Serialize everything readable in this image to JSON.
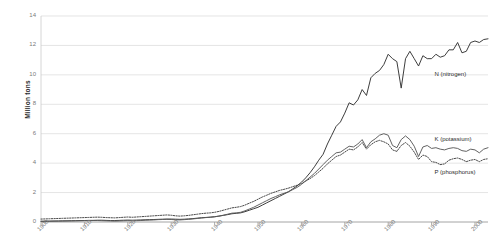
{
  "chart_data": {
    "type": "line",
    "title": "",
    "xlabel": "",
    "ylabel": "Million tons",
    "xlim": [
      1900,
      2003
    ],
    "ylim": [
      0,
      14
    ],
    "ytick_labels": [
      "0",
      "2",
      "4",
      "6",
      "8",
      "10",
      "12",
      "14"
    ],
    "ytick_values": [
      0,
      2,
      4,
      6,
      8,
      10,
      12,
      14
    ],
    "xtick_labels": [
      "1900",
      "1910",
      "1920",
      "1930",
      "1940",
      "1950",
      "1960",
      "1970",
      "1980",
      "1990",
      "2000"
    ],
    "xtick_values": [
      1900,
      1910,
      1920,
      1930,
      1940,
      1950,
      1960,
      1970,
      1980,
      1990,
      2000
    ],
    "grid": "horizontal",
    "legend_position": "inline-right",
    "series": [
      {
        "name": "N (nitrogen)",
        "style": "solid",
        "color": "#333333",
        "label_x": 2.5,
        "label_y": 10.0,
        "x": [
          1900,
          1901,
          1902,
          1903,
          1904,
          1905,
          1906,
          1907,
          1908,
          1909,
          1910,
          1911,
          1912,
          1913,
          1914,
          1915,
          1916,
          1917,
          1918,
          1919,
          1920,
          1921,
          1922,
          1923,
          1924,
          1925,
          1926,
          1927,
          1928,
          1929,
          1930,
          1931,
          1932,
          1933,
          1934,
          1935,
          1936,
          1937,
          1938,
          1939,
          1940,
          1941,
          1942,
          1943,
          1944,
          1945,
          1946,
          1947,
          1948,
          1949,
          1950,
          1951,
          1952,
          1953,
          1954,
          1955,
          1956,
          1957,
          1958,
          1959,
          1960,
          1961,
          1962,
          1963,
          1964,
          1965,
          1966,
          1967,
          1968,
          1969,
          1970,
          1971,
          1972,
          1973,
          1974,
          1975,
          1976,
          1977,
          1978,
          1979,
          1980,
          1981,
          1982,
          1983,
          1984,
          1985,
          1986,
          1987,
          1988,
          1989,
          1990,
          1991,
          1992,
          1993,
          1994,
          1995,
          1996,
          1997,
          1998,
          1999,
          2000,
          2001,
          2002,
          2003
        ],
        "y": [
          0.05,
          0.06,
          0.06,
          0.07,
          0.07,
          0.08,
          0.08,
          0.09,
          0.09,
          0.1,
          0.1,
          0.11,
          0.11,
          0.12,
          0.12,
          0.11,
          0.1,
          0.1,
          0.11,
          0.12,
          0.13,
          0.12,
          0.13,
          0.14,
          0.15,
          0.16,
          0.17,
          0.18,
          0.19,
          0.2,
          0.2,
          0.19,
          0.18,
          0.19,
          0.21,
          0.23,
          0.26,
          0.29,
          0.31,
          0.33,
          0.36,
          0.4,
          0.45,
          0.5,
          0.56,
          0.59,
          0.62,
          0.7,
          0.8,
          0.9,
          1.0,
          1.15,
          1.3,
          1.45,
          1.6,
          1.75,
          1.9,
          2.05,
          2.25,
          2.45,
          2.7,
          3.0,
          3.35,
          3.75,
          4.2,
          4.6,
          5.3,
          5.9,
          6.5,
          6.8,
          7.4,
          8.1,
          7.95,
          8.3,
          9.0,
          8.6,
          9.8,
          10.1,
          10.3,
          10.7,
          11.4,
          11.1,
          10.9,
          9.1,
          11.1,
          11.6,
          11.1,
          10.6,
          11.3,
          11.1,
          11.1,
          11.4,
          11.2,
          11.3,
          11.7,
          11.7,
          12.2,
          11.5,
          11.6,
          12.2,
          12.3,
          12.2,
          12.4,
          12.45
        ]
      },
      {
        "name": "K (potassium)",
        "style": "solid",
        "color": "#5a5a5a",
        "label_x": 2.5,
        "label_y": 5.6,
        "x": [
          1900,
          1901,
          1902,
          1903,
          1904,
          1905,
          1906,
          1907,
          1908,
          1909,
          1910,
          1911,
          1912,
          1913,
          1914,
          1915,
          1916,
          1917,
          1918,
          1919,
          1920,
          1921,
          1922,
          1923,
          1924,
          1925,
          1926,
          1927,
          1928,
          1929,
          1930,
          1931,
          1932,
          1933,
          1934,
          1935,
          1936,
          1937,
          1938,
          1939,
          1940,
          1941,
          1942,
          1943,
          1944,
          1945,
          1946,
          1947,
          1948,
          1949,
          1950,
          1951,
          1952,
          1953,
          1954,
          1955,
          1956,
          1957,
          1958,
          1959,
          1960,
          1961,
          1962,
          1963,
          1964,
          1965,
          1966,
          1967,
          1968,
          1969,
          1970,
          1971,
          1972,
          1973,
          1974,
          1975,
          1976,
          1977,
          1978,
          1979,
          1980,
          1981,
          1982,
          1983,
          1984,
          1985,
          1986,
          1987,
          1988,
          1989,
          1990,
          1991,
          1992,
          1993,
          1994,
          1995,
          1996,
          1997,
          1998,
          1999,
          2000,
          2001,
          2002,
          2003
        ],
        "y": [
          0.04,
          0.04,
          0.05,
          0.05,
          0.06,
          0.06,
          0.07,
          0.07,
          0.08,
          0.08,
          0.09,
          0.09,
          0.1,
          0.1,
          0.09,
          0.08,
          0.07,
          0.06,
          0.07,
          0.08,
          0.09,
          0.08,
          0.09,
          0.1,
          0.12,
          0.13,
          0.14,
          0.16,
          0.17,
          0.18,
          0.17,
          0.15,
          0.14,
          0.16,
          0.18,
          0.21,
          0.24,
          0.27,
          0.3,
          0.32,
          0.35,
          0.4,
          0.46,
          0.53,
          0.6,
          0.62,
          0.66,
          0.76,
          0.88,
          1.0,
          1.15,
          1.3,
          1.45,
          1.6,
          1.72,
          1.85,
          1.95,
          2.05,
          2.2,
          2.35,
          2.55,
          2.8,
          3.05,
          3.3,
          3.6,
          3.9,
          4.2,
          4.45,
          4.7,
          4.75,
          4.95,
          5.15,
          5.1,
          5.3,
          5.6,
          5.05,
          5.45,
          5.65,
          5.9,
          6.0,
          5.9,
          5.2,
          5.05,
          5.6,
          5.85,
          5.6,
          5.15,
          4.45,
          5.1,
          5.2,
          5.0,
          5.05,
          4.95,
          4.9,
          5.0,
          5.05,
          5.0,
          4.85,
          4.8,
          4.95,
          4.9,
          4.7,
          4.95,
          5.05
        ]
      },
      {
        "name": "P (phosphorus)",
        "style": "dotted",
        "color": "#4a4a4a",
        "label_x": 2.5,
        "label_y": 3.3,
        "x": [
          1900,
          1901,
          1902,
          1903,
          1904,
          1905,
          1906,
          1907,
          1908,
          1909,
          1910,
          1911,
          1912,
          1913,
          1914,
          1915,
          1916,
          1917,
          1918,
          1919,
          1920,
          1921,
          1922,
          1923,
          1924,
          1925,
          1926,
          1927,
          1928,
          1929,
          1930,
          1931,
          1932,
          1933,
          1934,
          1935,
          1936,
          1937,
          1938,
          1939,
          1940,
          1941,
          1942,
          1943,
          1944,
          1945,
          1946,
          1947,
          1948,
          1949,
          1950,
          1951,
          1952,
          1953,
          1954,
          1955,
          1956,
          1957,
          1958,
          1959,
          1960,
          1961,
          1962,
          1963,
          1964,
          1965,
          1966,
          1967,
          1968,
          1969,
          1970,
          1971,
          1972,
          1973,
          1974,
          1975,
          1976,
          1977,
          1978,
          1979,
          1980,
          1981,
          1982,
          1983,
          1984,
          1985,
          1986,
          1987,
          1988,
          1989,
          1990,
          1991,
          1992,
          1993,
          1994,
          1995,
          1996,
          1997,
          1998,
          1999,
          2000,
          2001,
          2002,
          2003
        ],
        "y": [
          0.2,
          0.21,
          0.22,
          0.23,
          0.24,
          0.25,
          0.26,
          0.27,
          0.28,
          0.29,
          0.3,
          0.31,
          0.32,
          0.33,
          0.32,
          0.3,
          0.29,
          0.28,
          0.3,
          0.32,
          0.34,
          0.32,
          0.34,
          0.36,
          0.38,
          0.4,
          0.42,
          0.44,
          0.46,
          0.48,
          0.46,
          0.42,
          0.4,
          0.42,
          0.45,
          0.49,
          0.53,
          0.57,
          0.6,
          0.62,
          0.66,
          0.72,
          0.8,
          0.88,
          0.96,
          1.0,
          1.05,
          1.15,
          1.28,
          1.4,
          1.55,
          1.7,
          1.82,
          1.95,
          2.05,
          2.15,
          2.22,
          2.3,
          2.4,
          2.5,
          2.62,
          2.78,
          2.95,
          3.15,
          3.4,
          3.65,
          3.95,
          4.2,
          4.45,
          4.55,
          4.75,
          4.95,
          4.9,
          5.1,
          5.4,
          4.95,
          5.25,
          5.45,
          5.55,
          5.45,
          5.3,
          4.9,
          4.8,
          5.2,
          5.4,
          5.15,
          4.75,
          4.25,
          4.55,
          4.45,
          4.1,
          4.05,
          3.9,
          3.95,
          4.2,
          4.3,
          4.35,
          4.25,
          4.1,
          4.2,
          4.25,
          4.1,
          4.25,
          4.3
        ]
      }
    ]
  },
  "axis": {
    "ylabel": "Million tons"
  }
}
